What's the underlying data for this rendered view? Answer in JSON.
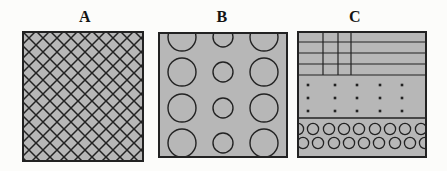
{
  "figure": {
    "background": "#fcfcfa",
    "square_fill": "#b7b7b7",
    "line_color": "#222222",
    "labels": [
      {
        "text": "A",
        "x": 85,
        "y": 9
      },
      {
        "text": "B",
        "x": 222,
        "y": 9
      },
      {
        "text": "C",
        "x": 355,
        "y": 9
      }
    ],
    "panels": [
      {
        "id": "A",
        "description": "square filled with diagonal crosshatch pattern",
        "x": 22,
        "y": 31,
        "width": 122,
        "height": 131,
        "pattern": {
          "type": "crosshatch",
          "cell": 14,
          "line_width": 1.5
        }
      },
      {
        "id": "B",
        "description": "square with 3x4 grid of outlined circles, larger in outer columns, top row clipped",
        "x": 158,
        "y": 32,
        "width": 130,
        "height": 126,
        "pattern": {
          "type": "circle-grid",
          "cols": [
            24,
            65,
            106
          ],
          "rows": [
            5,
            40,
            76,
            111
          ],
          "radii": [
            14,
            10,
            14
          ],
          "stroke_width": 1.4
        }
      },
      {
        "id": "C",
        "description": "square with three bands: ruled grid with partial vertical lines, dot grid, two staggered rows of small circles",
        "x": 297,
        "y": 31,
        "width": 130,
        "height": 127,
        "pattern": {
          "type": "bands",
          "grid_hlines": [
            11,
            22,
            33,
            44
          ],
          "grid_vlines": [
            26,
            41,
            54
          ],
          "grid_vline_bottom": 44,
          "dot_rows": [
            54,
            67,
            80
          ],
          "dot_cols": [
            11,
            38,
            60,
            83,
            105
          ],
          "dot_size": 2.6,
          "separator_y": 87,
          "circle_radius": 5.6,
          "stroke_width": 1.3,
          "circle_rows": [
            {
              "y": 98,
              "xs": [
                1,
                16,
                32,
                47,
                62,
                78,
                93,
                108,
                124
              ]
            },
            {
              "y": 112,
              "xs": [
                6,
                21,
                37,
                52,
                67,
                82,
                98,
                113,
                128
              ]
            }
          ]
        }
      }
    ]
  }
}
